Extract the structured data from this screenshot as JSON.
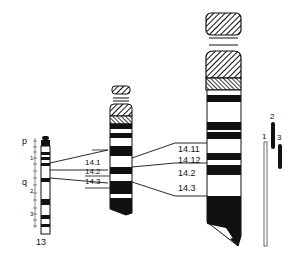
{
  "figure": {
    "type": "chromosome-ideogram",
    "chromosome": "13",
    "colors": {
      "ink": "#111111",
      "paper": "#ffffff",
      "line": "#555555"
    }
  },
  "small_chromosome": {
    "name": "13",
    "arm_labels": {
      "p": "p",
      "q": "q"
    },
    "p_ticks": [
      "1"
    ],
    "q_ticks": [
      "1",
      "2",
      "3",
      "4",
      "1",
      "2",
      "3",
      "1",
      "2",
      "3",
      "4"
    ],
    "region_labels": [
      "1",
      "2",
      "3"
    ]
  },
  "mid_chromosome": {
    "bands": [
      "14.1",
      "14.2",
      "14.3"
    ]
  },
  "large_chromosome": {
    "bands": [
      "14.11",
      "14.12",
      "14.2",
      "14.3"
    ]
  },
  "deletion_bars": {
    "labels": [
      "1",
      "2",
      "3"
    ]
  }
}
